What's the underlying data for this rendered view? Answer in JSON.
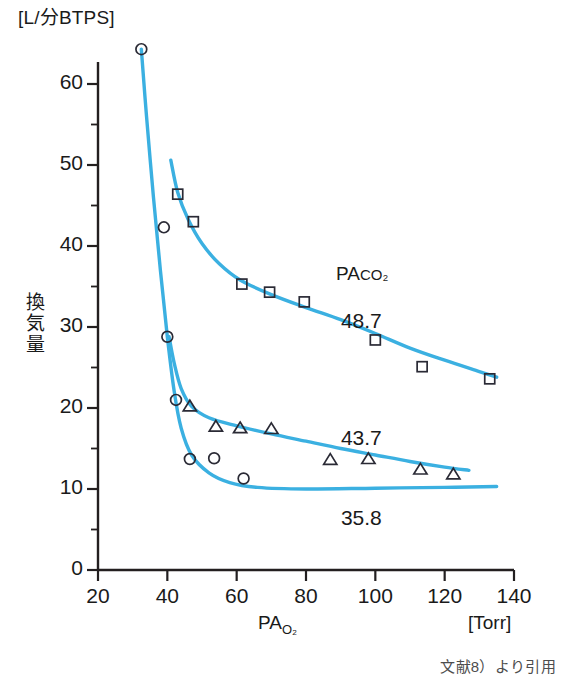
{
  "figure": {
    "unit_title": "[L/分BTPS]",
    "y_axis_label": "換気量",
    "x_axis_name_main": "PA",
    "x_axis_name_sub": "O₂",
    "x_axis_unit": "[Torr]",
    "group_label_main": "PA",
    "group_label_sub": "CO₂",
    "credit": "文献8）より引用",
    "line_color": "#3bb0e1",
    "axis_color": "#231f20",
    "marker_stroke": "#2a2a35"
  },
  "chart_data": {
    "type": "scatter",
    "title": "",
    "xlabel": "PAO₂",
    "ylabel": "換気量",
    "x_unit": "[Torr]",
    "y_unit": "[L/分BTPS]",
    "xlim": [
      20,
      140
    ],
    "ylim": [
      0,
      65
    ],
    "xticks": [
      20,
      40,
      60,
      80,
      100,
      120,
      140
    ],
    "yticks": [
      0,
      10,
      20,
      30,
      40,
      50,
      60
    ],
    "y_minor_ticks": [
      5,
      15,
      25,
      35,
      45,
      55,
      65
    ],
    "grid": false,
    "legend": "inline-annotations",
    "series": [
      {
        "name": "48.7",
        "marker": "square",
        "annotation": "48.7",
        "annotation_x": 97,
        "annotation_y": 30.5,
        "points": [
          {
            "x": 43.0,
            "y": 46.4
          },
          {
            "x": 47.5,
            "y": 43.0
          },
          {
            "x": 61.5,
            "y": 35.3
          },
          {
            "x": 69.5,
            "y": 34.3
          },
          {
            "x": 79.5,
            "y": 33.1
          },
          {
            "x": 100.0,
            "y": 28.4
          },
          {
            "x": 113.5,
            "y": 25.1
          },
          {
            "x": 133.0,
            "y": 23.6
          }
        ],
        "curve": [
          {
            "x": 41.0,
            "y": 50.6
          },
          {
            "x": 43.0,
            "y": 46.6
          },
          {
            "x": 46.0,
            "y": 43.3
          },
          {
            "x": 50.0,
            "y": 40.3
          },
          {
            "x": 55.0,
            "y": 37.8
          },
          {
            "x": 61.0,
            "y": 35.8
          },
          {
            "x": 70.0,
            "y": 34.0
          },
          {
            "x": 80.0,
            "y": 32.4
          },
          {
            "x": 90.0,
            "y": 30.9
          },
          {
            "x": 100.0,
            "y": 29.2
          },
          {
            "x": 110.0,
            "y": 27.4
          },
          {
            "x": 120.0,
            "y": 25.9
          },
          {
            "x": 130.0,
            "y": 24.5
          },
          {
            "x": 135.0,
            "y": 23.8
          }
        ]
      },
      {
        "name": "43.7",
        "marker": "triangle",
        "annotation": "43.7",
        "annotation_x": 97,
        "annotation_y": 16.0,
        "points": [
          {
            "x": 46.5,
            "y": 20.2
          },
          {
            "x": 54.0,
            "y": 17.7
          },
          {
            "x": 61.0,
            "y": 17.5
          },
          {
            "x": 70.0,
            "y": 17.4
          },
          {
            "x": 87.0,
            "y": 13.6
          },
          {
            "x": 98.0,
            "y": 13.7
          },
          {
            "x": 113.0,
            "y": 12.4
          },
          {
            "x": 122.5,
            "y": 11.8
          }
        ],
        "curve": [
          {
            "x": 40.5,
            "y": 28.8
          },
          {
            "x": 42.0,
            "y": 25.5
          },
          {
            "x": 44.0,
            "y": 22.4
          },
          {
            "x": 47.0,
            "y": 20.2
          },
          {
            "x": 52.0,
            "y": 18.8
          },
          {
            "x": 60.0,
            "y": 17.8
          },
          {
            "x": 70.0,
            "y": 16.8
          },
          {
            "x": 80.0,
            "y": 15.9
          },
          {
            "x": 90.0,
            "y": 15.0
          },
          {
            "x": 100.0,
            "y": 14.2
          },
          {
            "x": 110.0,
            "y": 13.4
          },
          {
            "x": 120.0,
            "y": 12.7
          },
          {
            "x": 127.0,
            "y": 12.3
          }
        ]
      },
      {
        "name": "35.8",
        "marker": "circle",
        "annotation": "35.8",
        "annotation_x": 97,
        "annotation_y": 6.2,
        "points": [
          {
            "x": 32.5,
            "y": 64.3
          },
          {
            "x": 39.0,
            "y": 42.3
          },
          {
            "x": 40.0,
            "y": 28.8
          },
          {
            "x": 42.5,
            "y": 21.0
          },
          {
            "x": 46.5,
            "y": 13.7
          },
          {
            "x": 53.5,
            "y": 13.8
          },
          {
            "x": 62.0,
            "y": 11.3
          }
        ],
        "curve": [
          {
            "x": 32.5,
            "y": 64.3
          },
          {
            "x": 34.0,
            "y": 56.0
          },
          {
            "x": 36.0,
            "y": 46.0
          },
          {
            "x": 38.0,
            "y": 37.0
          },
          {
            "x": 40.0,
            "y": 28.8
          },
          {
            "x": 42.0,
            "y": 22.0
          },
          {
            "x": 44.0,
            "y": 17.5
          },
          {
            "x": 47.0,
            "y": 14.2
          },
          {
            "x": 52.0,
            "y": 12.0
          },
          {
            "x": 58.0,
            "y": 10.8
          },
          {
            "x": 66.0,
            "y": 10.2
          },
          {
            "x": 80.0,
            "y": 10.0
          },
          {
            "x": 100.0,
            "y": 10.1
          },
          {
            "x": 120.0,
            "y": 10.2
          },
          {
            "x": 135.0,
            "y": 10.3
          }
        ]
      }
    ]
  }
}
